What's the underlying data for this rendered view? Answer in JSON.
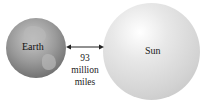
{
  "diagram": {
    "earth": {
      "label": "Earth"
    },
    "sun": {
      "label": "Sun"
    },
    "distance": {
      "line1": "93",
      "line2": "million",
      "line3": "miles"
    }
  }
}
